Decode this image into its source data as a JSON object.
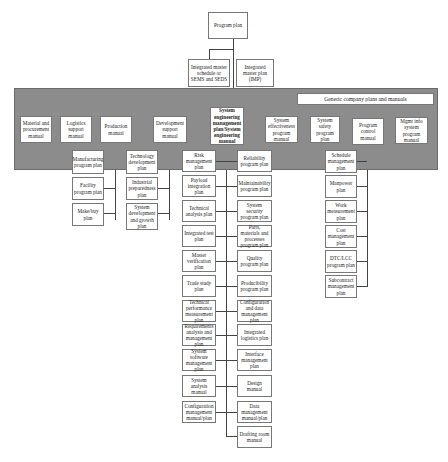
{
  "diagram": {
    "root": "Program plan",
    "level2": [
      "Integrated master schedule or SEMS and SEDS",
      "Integrated master plan (IMP)"
    ],
    "band_label": "Generic company plans and manuals",
    "manuals": [
      "Material and procurement manual",
      "Logistics support manual",
      "Production manual",
      "Development support manual",
      "System engineering management plan/System engineering manual",
      "System effectiveness program manual",
      "System safety program plan",
      "Program control manual",
      "Mgmt info system program manual"
    ],
    "production_children": [
      "Manufacturing program plan",
      "Facility program plan",
      "Make/buy plan"
    ],
    "development_children": [
      "Technology development plan",
      "Industrial preparedness plan",
      "System development and growth plan"
    ],
    "seng_left_children": [
      "Risk management plan",
      "Payload integration plan",
      "Technical analysis plan",
      "Integrated test plan",
      "Master verification plan",
      "Trade study plan",
      "Technical performance measurement plan",
      "Requirements analysis and management plan",
      "System software management plan",
      "System analysis manual",
      "Configuration management manual/plan"
    ],
    "seng_right_children": [
      "Reliability program plan",
      "Maintainability program plan",
      "System security program plan",
      "Parts, materials and processes program plan",
      "Quality program plan",
      "Producibility program plan",
      "Configuration and data management plan",
      "Integrated logistics plan",
      "Interface management plan",
      "Design manual",
      "Data management manual/plan",
      "Drafting room manual"
    ],
    "program_control_children": [
      "Schedule management plan",
      "Manpower plan",
      "Work measurement plan",
      "Cost management plan",
      "DTC/LCC program plan",
      "Subcontract management plan"
    ]
  }
}
